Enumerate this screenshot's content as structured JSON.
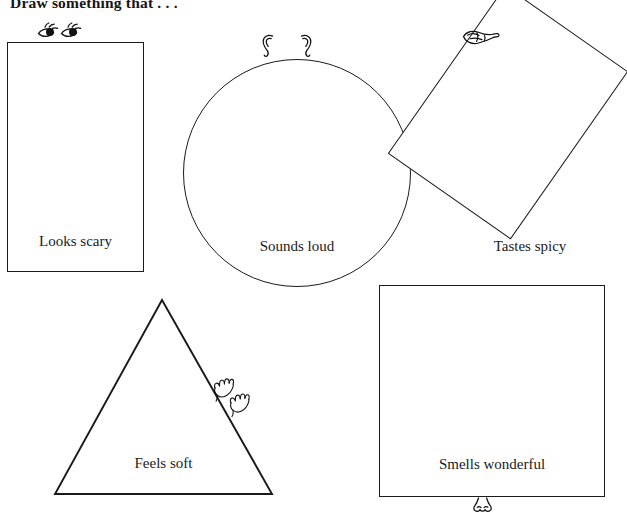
{
  "worksheet": {
    "title": "Draw something that . . .",
    "shapes": [
      {
        "id": "looks-scary",
        "shape": "rectangle",
        "label": "Looks scary",
        "sense": "sight",
        "icon": "eyes-icon",
        "icon_count": 2
      },
      {
        "id": "sounds-loud",
        "shape": "circle",
        "label": "Sounds loud",
        "sense": "hearing",
        "icon": "ears-icon",
        "icon_count": 2
      },
      {
        "id": "tastes-spicy",
        "shape": "rotated-rectangle",
        "label": "Tastes spicy",
        "sense": "taste",
        "icon": "tongue-icon",
        "icon_count": 1
      },
      {
        "id": "feels-soft",
        "shape": "triangle",
        "label": "Feels soft",
        "sense": "touch",
        "icon": "hands-icon",
        "icon_count": 2
      },
      {
        "id": "smells-wonderful",
        "shape": "square",
        "label": "Smells wonderful",
        "sense": "smell",
        "icon": "nose-icon",
        "icon_count": 1
      }
    ],
    "colors": {
      "ink": "#1a1a1a",
      "paper": "#ffffff"
    }
  }
}
